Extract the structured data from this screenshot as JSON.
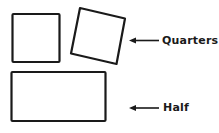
{
  "diagram": {
    "type": "paper-folding-illustration",
    "shapes": [
      {
        "name": "quarter-square-1",
        "kind": "square",
        "rotation_deg": 0
      },
      {
        "name": "quarter-square-2",
        "kind": "square",
        "rotation_deg": 14
      },
      {
        "name": "half-rectangle",
        "kind": "rectangle",
        "rotation_deg": 0
      }
    ],
    "labels": {
      "quarters": "Quarters",
      "half": "Half"
    },
    "colors": {
      "stroke": "#1a1a1a",
      "background": "#ffffff"
    }
  }
}
